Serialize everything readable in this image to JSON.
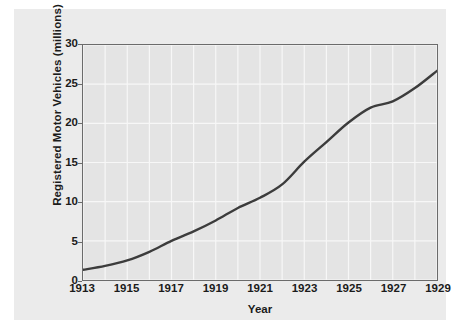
{
  "chart_data": {
    "type": "line",
    "title": "",
    "xlabel": "Year",
    "ylabel": "Registered Motor Vehicles (millions)",
    "xlim": [
      1913,
      1929
    ],
    "ylim": [
      0,
      30
    ],
    "grid": true,
    "legend": "none",
    "x_tick_labels": [
      "1913",
      "1915",
      "1917",
      "1919",
      "1921",
      "1923",
      "1925",
      "1927",
      "1929"
    ],
    "y_tick_labels": [
      "0",
      "5",
      "10",
      "15",
      "20",
      "25",
      "30"
    ],
    "x_tick_values": [
      1913,
      1915,
      1917,
      1919,
      1921,
      1923,
      1925,
      1927,
      1929
    ],
    "y_tick_values": [
      0,
      5,
      10,
      15,
      20,
      25,
      30
    ],
    "x": [
      1913,
      1914,
      1915,
      1916,
      1917,
      1918,
      1919,
      1920,
      1921,
      1922,
      1923,
      1924,
      1925,
      1926,
      1927,
      1928,
      1929
    ],
    "values": [
      1.3,
      1.8,
      2.5,
      3.6,
      5.0,
      6.2,
      7.6,
      9.2,
      10.5,
      12.2,
      15.1,
      17.6,
      20.1,
      22.0,
      22.8,
      24.5,
      26.7
    ],
    "series": [
      {
        "name": "Registered Motor Vehicles",
        "color": "#3c3c3c",
        "values": [
          1.3,
          1.8,
          2.5,
          3.6,
          5.0,
          6.2,
          7.6,
          9.2,
          10.5,
          12.2,
          15.1,
          17.6,
          20.1,
          22.0,
          22.8,
          24.5,
          26.7
        ]
      }
    ]
  },
  "style": {
    "plot_background": "#e4e4e4",
    "card_background": "#ebebeb",
    "gridline_color": "#f7f7f7",
    "frame_color": "#6b6b6b",
    "line_color": "#3c3c3c",
    "text_color": "#1b1b1b"
  }
}
